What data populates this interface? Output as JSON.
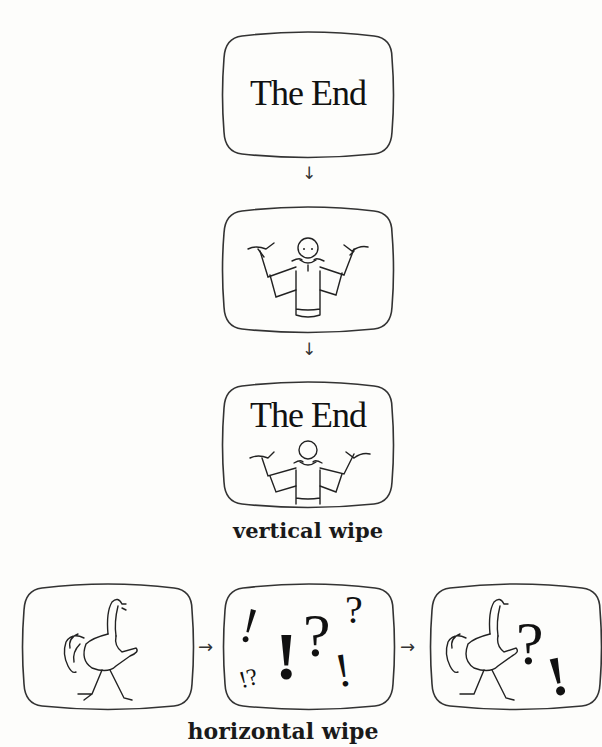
{
  "vertical_wipe": {
    "frames": [
      {
        "id": "frame-1",
        "text": "The End",
        "content": "title-card"
      },
      {
        "id": "frame-2",
        "content": "man-shrugging"
      },
      {
        "id": "frame-3",
        "text": "The End",
        "content": "title-card-with-man"
      }
    ],
    "arrows": [
      "↓",
      "↓"
    ],
    "caption": "vertical wipe"
  },
  "horizontal_wipe": {
    "frames": [
      {
        "id": "frame-1",
        "content": "ostrich-bird"
      },
      {
        "id": "frame-2",
        "content": "punctuation-marks",
        "glyphs": [
          "!",
          "!?",
          "!",
          "?",
          "?",
          "!"
        ]
      },
      {
        "id": "frame-3",
        "content": "ostrich-bird-with-punctuation",
        "glyphs": [
          "?",
          "!"
        ]
      }
    ],
    "arrows": [
      "→",
      "→"
    ],
    "caption": "horizontal wipe"
  },
  "colors": {
    "ink": "#1a1a1a",
    "paper": "#fdfdfb"
  }
}
